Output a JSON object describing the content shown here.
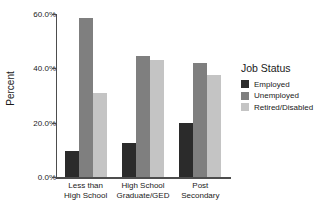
{
  "chart_data": {
    "type": "bar",
    "title": "",
    "xlabel": "",
    "ylabel": "Percent",
    "ylim": [
      0,
      60
    ],
    "ytick_labels": [
      "0.0%",
      "20.0%",
      "40.0%",
      "60.0%"
    ],
    "ytick_values": [
      0,
      20,
      40,
      60
    ],
    "grid": false,
    "legend_position": "right",
    "legend_title": "Job Status",
    "categories": [
      "Less than\nHigh School",
      "High School\nGraduate/GED",
      "Post\nSecondary"
    ],
    "series": [
      {
        "name": "Employed",
        "color": "#2b2b2b",
        "values": [
          9.5,
          12.5,
          20.0
        ]
      },
      {
        "name": "Unemployed",
        "color": "#7f7f7f",
        "values": [
          58.7,
          44.5,
          42.0
        ]
      },
      {
        "name": "Retired/Disabled",
        "color": "#c4c4c4",
        "values": [
          31.0,
          43.0,
          37.5
        ]
      }
    ]
  }
}
